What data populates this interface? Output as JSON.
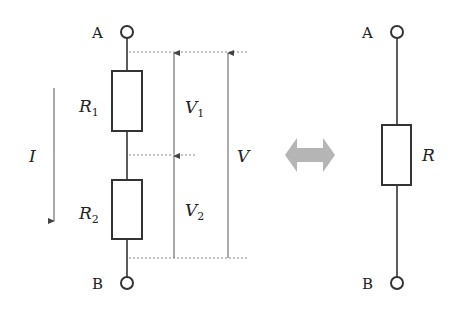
{
  "diagram": {
    "type": "circuit",
    "left_circuit": {
      "terminal_top": "A",
      "terminal_bottom": "B",
      "resistors": [
        {
          "name": "R",
          "sub": "1"
        },
        {
          "name": "R",
          "sub": "2"
        }
      ],
      "current": {
        "name": "I",
        "direction": "down"
      },
      "voltages": [
        {
          "name": "V",
          "sub": "1"
        },
        {
          "name": "V",
          "sub": "2"
        },
        {
          "name": "V",
          "sub": ""
        }
      ]
    },
    "equivalence_arrow": {
      "glyph": "double-arrow",
      "color": "#b5b5b5"
    },
    "right_circuit": {
      "terminal_top": "A",
      "terminal_bottom": "B",
      "resistor": {
        "name": "R"
      }
    },
    "colors": {
      "line": "#333333",
      "dashed": "#888888",
      "arrow_fill": "#b5b5b5"
    }
  }
}
